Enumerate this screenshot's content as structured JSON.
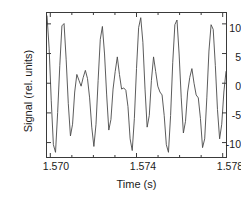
{
  "chart_data": {
    "type": "line",
    "title": "",
    "xlabel": "Time (s)",
    "ylabel": "Signal (rel. units)",
    "xlim": [
      1.5698,
      1.5782
    ],
    "ylim": [
      -12.6,
      12.0
    ],
    "xticks": [
      1.57,
      1.574,
      1.578
    ],
    "xtick_labels": [
      "1.570",
      "1.574",
      "1.578"
    ],
    "xminor_ticks": [
      1.571,
      1.572,
      1.573,
      1.575,
      1.576,
      1.577
    ],
    "yticks": [
      10,
      5,
      0,
      -5,
      -10
    ],
    "ytick_labels": [
      "10",
      "5",
      "0",
      "-5",
      "-10"
    ],
    "grid": false,
    "legend": null,
    "line_color": "#4a4a4a",
    "line_width": 0.9,
    "frame_color": "#3a3a3a",
    "background": "#ffffff",
    "series": [
      {
        "name": "signal",
        "x": [
          1.5698,
          1.5699,
          1.57,
          1.5701,
          1.5702,
          1.5703,
          1.5704,
          1.5705,
          1.5706,
          1.5707,
          1.5708,
          1.5709,
          1.571,
          1.5711,
          1.5712,
          1.5713,
          1.5714,
          1.5715,
          1.5716,
          1.5717,
          1.5718,
          1.5719,
          1.572,
          1.5721,
          1.5722,
          1.5723,
          1.5724,
          1.5725,
          1.5726,
          1.5727,
          1.5728,
          1.5729,
          1.573,
          1.5731,
          1.5732,
          1.5733,
          1.5734,
          1.5735,
          1.5736,
          1.5737,
          1.5738,
          1.5739,
          1.574,
          1.5741,
          1.5742,
          1.5743,
          1.5744,
          1.5745,
          1.5746,
          1.5747,
          1.5748,
          1.5749,
          1.575,
          1.5751,
          1.5752,
          1.5753,
          1.5754,
          1.5755,
          1.5756,
          1.5757,
          1.5758,
          1.5759,
          1.576,
          1.5761,
          1.5762,
          1.5763,
          1.5764,
          1.5765,
          1.5766,
          1.5767,
          1.5768,
          1.5769,
          1.577,
          1.5771,
          1.5772,
          1.5773,
          1.5774,
          1.5775,
          1.5776,
          1.5777,
          1.5778,
          1.5779,
          1.578,
          1.5781,
          1.5782
        ],
        "y": [
          11.5,
          6.0,
          -3.0,
          -10.5,
          -11.8,
          -5.0,
          3.0,
          9.8,
          10.2,
          4.0,
          -3.5,
          -9.0,
          -7.0,
          -1.5,
          1.5,
          0.5,
          -0.5,
          1.0,
          2.2,
          0.8,
          -2.5,
          -7.5,
          -10.8,
          -7.0,
          0.5,
          7.5,
          9.7,
          5.0,
          -2.0,
          -8.0,
          -6.2,
          -1.0,
          2.0,
          4.5,
          1.5,
          -1.0,
          -0.8,
          -1.2,
          -4.0,
          -9.5,
          -11.5,
          -6.0,
          2.5,
          9.5,
          11.2,
          7.0,
          -1.0,
          -7.5,
          -5.5,
          0.5,
          4.5,
          2.0,
          -0.5,
          -1.5,
          -2.0,
          -5.5,
          -10.5,
          -11.8,
          -5.5,
          3.5,
          10.0,
          10.8,
          5.0,
          -2.5,
          -8.5,
          -6.5,
          -1.5,
          1.0,
          2.5,
          0.0,
          -2.0,
          -2.5,
          -6.0,
          -11.0,
          -9.5,
          -2.5,
          5.5,
          10.0,
          9.2,
          3.0,
          -4.5,
          -9.5,
          -7.0,
          -1.5,
          2.0
        ]
      }
    ]
  },
  "axes": {
    "ytick_labels": [
      "10",
      "5",
      "0",
      "-5",
      "-10"
    ],
    "xtick_labels": [
      "1.570",
      "1.574",
      "1.578"
    ],
    "xlabel": "Time (s)",
    "ylabel": "Signal (rel. units)"
  }
}
